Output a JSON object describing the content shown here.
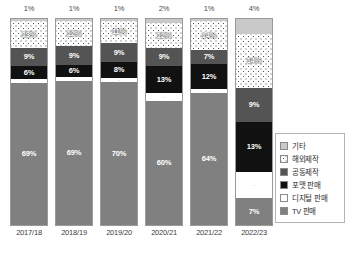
{
  "chart_data": {
    "type": "bar",
    "title": "",
    "subtitle": "",
    "xlabel": "",
    "ylabel": "",
    "ylim": [
      0,
      100
    ],
    "grid": false,
    "stacked": true,
    "legend_position": "right",
    "categories": [
      "2017/18",
      "2018/19",
      "2019/20",
      "2020/21",
      "2021/22",
      "2022/23"
    ],
    "series": [
      {
        "name": "TV 판매",
        "key": "tv",
        "color": "#808080",
        "values": [
          69,
          69,
          70,
          60,
          64,
          60
        ],
        "labels": [
          "69%",
          "69%",
          "70%",
          "60%",
          "64%",
          "60%"
        ]
      },
      {
        "name": "디지털 판매",
        "key": "digital",
        "color": "#ffffff",
        "values": [
          2,
          2,
          2,
          4,
          2,
          7
        ],
        "labels": [
          "2%",
          "2%",
          "2%",
          "4%",
          "2%",
          "7%"
        ]
      },
      {
        "name": "포맷 판매",
        "key": "format",
        "color": "#111111",
        "values": [
          6,
          6,
          8,
          13,
          12,
          13
        ],
        "labels": [
          "6%",
          "6%",
          "8%",
          "13%",
          "12%",
          "13%"
        ]
      },
      {
        "name": "공동제작",
        "key": "joint",
        "color": "#545454",
        "values": [
          9,
          9,
          9,
          9,
          7,
          9
        ],
        "labels": [
          "9%",
          "9%",
          "9%",
          "9%",
          "7%",
          "9%"
        ]
      },
      {
        "name": "해외제작",
        "key": "overseas",
        "color": "#ffffff",
        "pattern": "checker",
        "values": [
          13,
          12,
          11,
          12,
          14,
          14
        ],
        "labels": [
          "13%",
          "12%",
          "11%",
          "12%",
          "14%",
          "14%"
        ]
      },
      {
        "name": "기타",
        "key": "etc",
        "color": "#c9c9c9",
        "values": [
          1,
          1,
          1,
          2,
          1,
          4
        ],
        "labels": [
          "1%",
          "1%",
          "1%",
          "2%",
          "1%",
          "4%"
        ]
      }
    ],
    "top_annotations": [
      "1%",
      "1%",
      "1%",
      "2%",
      "1%",
      "4%"
    ]
  },
  "bars": [
    {
      "category": "2017/18",
      "top_note": "1%",
      "segments": [
        {
          "series": "기타",
          "cls": "s-etc",
          "value": 1,
          "label": "1%"
        },
        {
          "series": "해외제작",
          "cls": "s-overseas",
          "value": 13,
          "label": "13%"
        },
        {
          "series": "공동제작",
          "cls": "s-joint",
          "value": 9,
          "label": "9%"
        },
        {
          "series": "포맷 판매",
          "cls": "s-format",
          "value": 6,
          "label": "6%"
        },
        {
          "series": "디지털 판매",
          "cls": "s-digital",
          "value": 2,
          "label": "·"
        },
        {
          "series": "TV 판매",
          "cls": "s-tv",
          "value": 69,
          "label": "69%"
        }
      ]
    },
    {
      "category": "2018/19",
      "top_note": "1%",
      "segments": [
        {
          "series": "기타",
          "cls": "s-etc",
          "value": 1,
          "label": "1%"
        },
        {
          "series": "해외제작",
          "cls": "s-overseas",
          "value": 12,
          "label": "12%"
        },
        {
          "series": "공동제작",
          "cls": "s-joint",
          "value": 9,
          "label": "9%"
        },
        {
          "series": "포맷 판매",
          "cls": "s-format",
          "value": 6,
          "label": "6%"
        },
        {
          "series": "디지털 판매",
          "cls": "s-digital",
          "value": 2,
          "label": "·"
        },
        {
          "series": "TV 판매",
          "cls": "s-tv",
          "value": 69,
          "label": "69%"
        }
      ]
    },
    {
      "category": "2019/20",
      "top_note": "1%",
      "segments": [
        {
          "series": "기타",
          "cls": "s-etc",
          "value": 1,
          "label": "1%"
        },
        {
          "series": "해외제작",
          "cls": "s-overseas",
          "value": 11,
          "label": "11%"
        },
        {
          "series": "공동제작",
          "cls": "s-joint",
          "value": 9,
          "label": "9%"
        },
        {
          "series": "포맷 판매",
          "cls": "s-format",
          "value": 8,
          "label": "8%"
        },
        {
          "series": "디지털 판매",
          "cls": "s-digital",
          "value": 2,
          "label": "·"
        },
        {
          "series": "TV 판매",
          "cls": "s-tv",
          "value": 70,
          "label": "70%"
        }
      ]
    },
    {
      "category": "2020/21",
      "top_note": "2%",
      "segments": [
        {
          "series": "기타",
          "cls": "s-etc",
          "value": 2,
          "label": "2%"
        },
        {
          "series": "해외제작",
          "cls": "s-overseas",
          "value": 12,
          "label": "12%"
        },
        {
          "series": "공동제작",
          "cls": "s-joint",
          "value": 9,
          "label": "9%"
        },
        {
          "series": "포맷 판매",
          "cls": "s-format",
          "value": 13,
          "label": "13%"
        },
        {
          "series": "디지털 판매",
          "cls": "s-digital",
          "value": 4,
          "label": "·"
        },
        {
          "series": "TV 판매",
          "cls": "s-tv",
          "value": 60,
          "label": "60%"
        }
      ]
    },
    {
      "category": "2021/22",
      "top_note": "1%",
      "segments": [
        {
          "series": "기타",
          "cls": "s-etc",
          "value": 1,
          "label": "1%"
        },
        {
          "series": "해외제작",
          "cls": "s-overseas",
          "value": 14,
          "label": "14%"
        },
        {
          "series": "공동제작",
          "cls": "s-joint",
          "value": 7,
          "label": "7%"
        },
        {
          "series": "포맷 판매",
          "cls": "s-format",
          "value": 12,
          "label": "12%"
        },
        {
          "series": "디지털 판매",
          "cls": "s-digital",
          "value": 2,
          "label": "·"
        },
        {
          "series": "TV 판매",
          "cls": "s-tv",
          "value": 64,
          "label": "64%"
        }
      ]
    },
    {
      "category": "2022/23",
      "top_note": "4%",
      "segments": [
        {
          "series": "기타",
          "cls": "s-etc",
          "value": 4,
          "label": "4%"
        },
        {
          "series": "해외제작",
          "cls": "s-overseas",
          "value": 14,
          "label": "14%"
        },
        {
          "series": "공동제작",
          "cls": "s-joint",
          "value": 9,
          "label": "9%"
        },
        {
          "series": "포맷 판매",
          "cls": "s-format",
          "value": 13,
          "label": "13%"
        },
        {
          "series": "디지털 판매",
          "cls": "s-digital",
          "value": 7,
          "label": "·"
        },
        {
          "series": "TV 판매",
          "cls": "s-tv",
          "value": 7,
          "label": "7%"
        }
      ]
    }
  ],
  "legend": {
    "items": [
      {
        "label": "기타",
        "cls": "s-etc"
      },
      {
        "label": "해외제작",
        "cls": "s-overseas"
      },
      {
        "label": "공동제작",
        "cls": "s-joint"
      },
      {
        "label": "포맷 판매",
        "cls": "s-format"
      },
      {
        "label": "디지털 판매",
        "cls": "s-digital"
      },
      {
        "label": "TV 판매",
        "cls": "s-tv"
      }
    ]
  }
}
